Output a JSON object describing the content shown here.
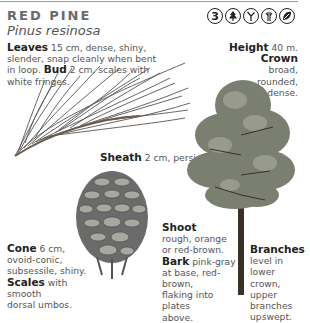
{
  "header": {
    "common_name": "RED PINE",
    "latin_name": "Pinus resinosa",
    "icons": [
      {
        "name": "zone-number-icon",
        "label": "3"
      },
      {
        "name": "conifer-tree-icon"
      },
      {
        "name": "needle-bundle-icon"
      },
      {
        "name": "twig-icon"
      },
      {
        "name": "leaf-shape-icon"
      }
    ]
  },
  "descriptions": {
    "leaves": {
      "term": "Leaves",
      "text": " 15 cm, dense, shiny, slender, snap cleanly when bent in loop. "
    },
    "bud": {
      "term": "Bud",
      "text": " 2 cm, scales with white fringes."
    },
    "height": {
      "term": "Height",
      "text": " 40 m."
    },
    "crown": {
      "term": "Crown",
      "lines": [
        "broad,",
        "rounded,",
        "dense."
      ]
    },
    "sheath": {
      "term": "Sheath",
      "text": " 2 cm, persistent."
    },
    "shoot": {
      "term": "Shoot",
      "lines": [
        "rough, orange",
        "or red-brown."
      ]
    },
    "bark": {
      "term": "Bark",
      "text": " pink-gray",
      "lines": [
        "at base, red-brown,",
        "flaking into plates",
        "above."
      ]
    },
    "cone": {
      "term": "Cone",
      "text": " 6 cm,",
      "lines": [
        "ovoid-conic,",
        "subsessile, shiny."
      ]
    },
    "scales": {
      "term": "Scales",
      "text": " with smooth",
      "lines": [
        "dorsal umbos."
      ]
    },
    "branches": {
      "term": "Branches",
      "lines": [
        "level in lower",
        "crown, upper",
        "branches",
        "upswept."
      ]
    }
  },
  "colors": {
    "title": "#6a6a6a",
    "body_text": "#555555",
    "bold_terms": "#222222"
  }
}
